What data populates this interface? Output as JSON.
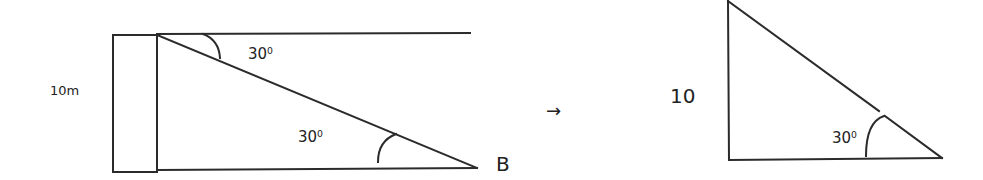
{
  "left_diagram": {
    "height_label": "10m",
    "angle_top": {
      "value": "30",
      "unit": "0"
    },
    "angle_bottom": {
      "value": "30",
      "unit": "0"
    },
    "point_label": "B"
  },
  "transition": {
    "arrow": "→"
  },
  "right_diagram": {
    "height_label": "10",
    "angle": {
      "value": "30",
      "unit": "0"
    }
  },
  "colors": {
    "stroke": "#2b2b2b",
    "background": "#ffffff",
    "text": "#222222"
  }
}
